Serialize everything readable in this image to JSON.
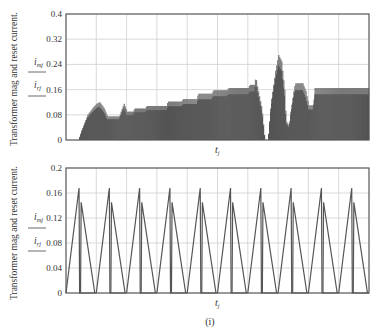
{
  "figure": {
    "caption": "(i)"
  },
  "chart_data": [
    {
      "type": "area",
      "title": "",
      "ylabel": "Transformer mag and reset current.",
      "legend": [
        "i_mj",
        "i_rj"
      ],
      "xlabel": "t_j",
      "ylim": [
        0,
        0.4
      ],
      "yticks": [
        0,
        0.08,
        0.16,
        0.24,
        0.32,
        0.4
      ],
      "ytick_labels": [
        "0",
        "0.08",
        "0.16",
        "0.24",
        "0.32",
        "0.4"
      ],
      "x_divisions": 10,
      "grid": true,
      "note": "dense switching ripple; envelope given as [x_fraction, y_value]",
      "envelope": [
        [
          0.0,
          0
        ],
        [
          0.04,
          0
        ],
        [
          0.05,
          0.03
        ],
        [
          0.07,
          0.08
        ],
        [
          0.09,
          0.105
        ],
        [
          0.1,
          0.115
        ],
        [
          0.11,
          0.12
        ],
        [
          0.125,
          0.1
        ],
        [
          0.135,
          0.075
        ],
        [
          0.145,
          0.075
        ],
        [
          0.175,
          0.075
        ],
        [
          0.18,
          0.09
        ],
        [
          0.19,
          0.115
        ],
        [
          0.2,
          0.09
        ],
        [
          0.22,
          0.09
        ],
        [
          0.225,
          0.1
        ],
        [
          0.26,
          0.1
        ],
        [
          0.265,
          0.108
        ],
        [
          0.33,
          0.108
        ],
        [
          0.335,
          0.122
        ],
        [
          0.38,
          0.122
        ],
        [
          0.385,
          0.13
        ],
        [
          0.43,
          0.13
        ],
        [
          0.435,
          0.147
        ],
        [
          0.48,
          0.147
        ],
        [
          0.485,
          0.158
        ],
        [
          0.53,
          0.158
        ],
        [
          0.535,
          0.165
        ],
        [
          0.6,
          0.165
        ],
        [
          0.605,
          0.175
        ],
        [
          0.62,
          0.175
        ],
        [
          0.625,
          0.2
        ],
        [
          0.63,
          0.17
        ],
        [
          0.645,
          0.1
        ],
        [
          0.655,
          0
        ],
        [
          0.665,
          0
        ],
        [
          0.675,
          0.12
        ],
        [
          0.69,
          0.22
        ],
        [
          0.7,
          0.27
        ],
        [
          0.71,
          0.25
        ],
        [
          0.72,
          0.16
        ],
        [
          0.725,
          0.06
        ],
        [
          0.735,
          0.045
        ],
        [
          0.74,
          0.09
        ],
        [
          0.75,
          0.155
        ],
        [
          0.755,
          0.18
        ],
        [
          0.78,
          0.18
        ],
        [
          0.79,
          0.155
        ],
        [
          0.8,
          0.11
        ],
        [
          0.815,
          0.11
        ],
        [
          0.82,
          0.165
        ],
        [
          1.0,
          0.165
        ]
      ]
    },
    {
      "type": "line",
      "title": "",
      "ylabel": "Transformer mag and reset current.",
      "legend": [
        "i_mj",
        "i_rj"
      ],
      "xlabel": "t_j",
      "ylim": [
        0,
        0.2
      ],
      "yticks": [
        0,
        0.04,
        0.08,
        0.12,
        0.16,
        0.2
      ],
      "ytick_labels": [
        "0",
        "0.04",
        "0.08",
        "0.12",
        "0.16",
        "0.2"
      ],
      "x_divisions": 10,
      "grid": true,
      "periods": 10,
      "series": [
        {
          "name": "i_mj (magnetizing)",
          "pattern": "rises 0 -> 0.168 over first 43% of period, drops to 0",
          "peak": 0.168,
          "rise_fraction": 0.43
        },
        {
          "name": "i_rj (reset)",
          "pattern": "jumps to 0.145 at 0.5 period, decays linearly to 0 at 0.95 period",
          "peak": 0.145,
          "start_fraction": 0.5,
          "end_fraction": 0.95
        }
      ]
    }
  ],
  "labels": {
    "top": {
      "ylabel": "Transformer mag and reset current.",
      "legend_top": "i",
      "legend_top_sub": "mj",
      "legend_bot": "i",
      "legend_bot_sub": "rj",
      "xlabel": "t",
      "xlabel_sub": "j"
    },
    "bottom": {
      "ylabel": "Transformer mag and reset current.",
      "legend_top": "i",
      "legend_top_sub": "mj",
      "legend_bot": "i",
      "legend_bot_sub": "rj",
      "xlabel": "t",
      "xlabel_sub": "j"
    }
  },
  "colors": {
    "axis": "#555555",
    "grid": "#cfcfcf",
    "fill": "#3a3a3a",
    "fill_light": "#7a7a7a",
    "line": "#555555"
  }
}
